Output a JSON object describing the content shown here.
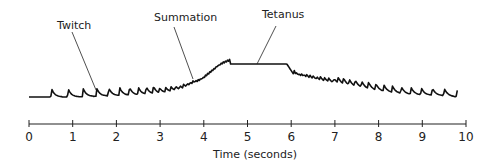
{
  "chart_data": {
    "type": "line",
    "title": "",
    "xlabel": "Time (seconds)",
    "ylabel": "",
    "xlim": [
      0,
      10
    ],
    "x_ticks": [
      "0",
      "1",
      "2",
      "3",
      "4",
      "5",
      "6",
      "7",
      "8",
      "9",
      "10"
    ],
    "grid": false,
    "legend": null,
    "series": [
      {
        "name": "Muscle contraction force",
        "description": "Twitches with increasing frequency summate into a smooth tetanus plateau (~4.6-5.9 s), then relax back to individual twitches",
        "x": [
          0,
          0.5,
          1,
          1.5,
          2,
          2.5,
          3,
          3.5,
          4,
          4.3,
          4.6,
          5,
          5.5,
          5.9,
          6.1,
          6.5,
          7,
          7.5,
          8,
          8.5,
          9,
          9.5,
          9.8
        ],
        "y": [
          0.0,
          0.0,
          0.0,
          0.02,
          0.04,
          0.06,
          0.1,
          0.2,
          0.45,
          0.8,
          1.0,
          1.0,
          1.0,
          1.0,
          0.6,
          0.5,
          0.4,
          0.3,
          0.18,
          0.1,
          0.06,
          0.04,
          0.0
        ]
      }
    ],
    "annotations": [
      {
        "text": "Twitch",
        "x": 1.5,
        "label_pos": [
          1.0,
          "top"
        ]
      },
      {
        "text": "Summation",
        "x": 3.8,
        "label_pos": [
          3.9,
          "top"
        ]
      },
      {
        "text": "Tetanus",
        "x": 5.3,
        "label_pos": [
          5.8,
          "top"
        ]
      }
    ]
  },
  "labels": {
    "twitch": "Twitch",
    "summation": "Summation",
    "tetanus": "Tetanus",
    "xlabel": "Time (seconds)"
  },
  "ticks": [
    "0",
    "1",
    "2",
    "3",
    "4",
    "5",
    "6",
    "7",
    "8",
    "9",
    "10"
  ]
}
